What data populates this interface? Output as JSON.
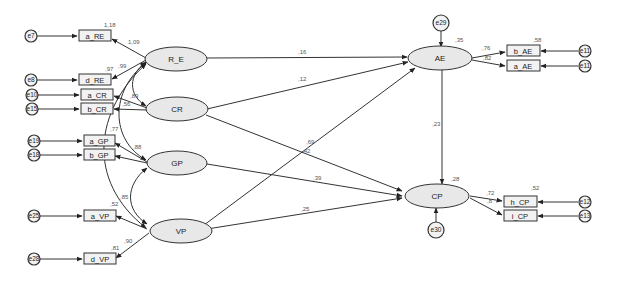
{
  "diagram": {
    "type": "structural-equation-model",
    "colors": {
      "latent_fill": "#e8e8e8",
      "stroke": "#333333",
      "label": "#555555",
      "background": "#ffffff"
    },
    "latent_variables": [
      {
        "id": "RE",
        "label": "R_E"
      },
      {
        "id": "CR",
        "label": "CR"
      },
      {
        "id": "GP",
        "label": "GP"
      },
      {
        "id": "VP",
        "label": "VP"
      },
      {
        "id": "AE",
        "label": "AE",
        "r2": ",35"
      },
      {
        "id": "CP",
        "label": "CP",
        "r2": ",28"
      }
    ],
    "indicators": [
      {
        "id": "a_RE",
        "label": "a_RE",
        "r2": "1,18"
      },
      {
        "id": "d_RE",
        "label": "d_RE",
        "r2": ",97"
      },
      {
        "id": "a_CR",
        "label": "a_CR"
      },
      {
        "id": "b_CR",
        "label": "b_CR"
      },
      {
        "id": "a_GP",
        "label": "a_GP",
        "r2": ",77"
      },
      {
        "id": "b_GP",
        "label": "b_GP"
      },
      {
        "id": "a_VP",
        "label": "a_VP",
        "r2": ",52"
      },
      {
        "id": "d_VP",
        "label": "d_VP",
        "r2": ",81"
      },
      {
        "id": "b_AE",
        "label": "b_AE",
        "r2": ",58"
      },
      {
        "id": "a_AE",
        "label": "a_AE"
      },
      {
        "id": "h_CP",
        "label": "h_CP",
        "r2": ",52"
      },
      {
        "id": "i_CP",
        "label": "i_CP"
      }
    ],
    "error_terms": [
      {
        "id": "e7",
        "label": "e7"
      },
      {
        "id": "e8",
        "label": "e8"
      },
      {
        "id": "e10",
        "label": "e10"
      },
      {
        "id": "e15",
        "label": "e15"
      },
      {
        "id": "e19",
        "label": "e19"
      },
      {
        "id": "e18",
        "label": "e18"
      },
      {
        "id": "e25",
        "label": "e25"
      },
      {
        "id": "e28",
        "label": "e28"
      },
      {
        "id": "e29",
        "label": "e29"
      },
      {
        "id": "e30",
        "label": "e30"
      },
      {
        "id": "e11a",
        "label": "e11"
      },
      {
        "id": "e11b",
        "label": "e11"
      },
      {
        "id": "e12",
        "label": "e12"
      },
      {
        "id": "e13",
        "label": "e13"
      }
    ],
    "loadings": {
      "RE_aRE": "1,09",
      "RE_dRE": ",99",
      "CR_aCR": ",89",
      "CR_bCR": ",56",
      "GP_aGP": ",88",
      "VP_dVP": ",90",
      "AE_bAE": ",76",
      "AE_aAE": ",82",
      "CP_hCP": ",72",
      "CP_iCP": ",8"
    },
    "paths": [
      {
        "from": "R_E",
        "to": "AE",
        "coef": ",16"
      },
      {
        "from": "CR",
        "to": "AE",
        "coef": ",12"
      },
      {
        "from": "VP",
        "to": "AE",
        "coef": ",69"
      },
      {
        "from": "CR",
        "to": "CP",
        "coef": ",42"
      },
      {
        "from": "GP",
        "to": "CP",
        "coef": ",39"
      },
      {
        "from": "VP",
        "to": "CP",
        "coef": ",25"
      },
      {
        "from": "AE",
        "to": "CP",
        "coef": ",23"
      }
    ],
    "covariances": [
      {
        "between": [
          "GP",
          "VP"
        ],
        "value": ",85"
      },
      {
        "between": [
          "CR",
          "VP"
        ],
        "value": ",4"
      }
    ]
  }
}
